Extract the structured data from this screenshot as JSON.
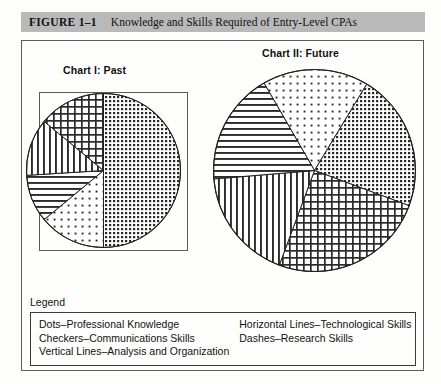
{
  "banner": {
    "figure_number": "FIGURE 1–1",
    "figure_title": "Knowledge and Skills Required of Entry-Level CPAs",
    "background_color": "#b9b9b9"
  },
  "charts": {
    "chart1_heading": "Chart I: Past",
    "chart2_heading": "Chart II: Future"
  },
  "legend": {
    "label": "Legend",
    "left_column": [
      "Dots–Professional Knowledge",
      "Checkers–Communications Skills",
      "Vertical Lines–Analysis and Organization"
    ],
    "right_column": [
      "Horizontal Lines–Technological Skills",
      "Dashes–Research Skills"
    ]
  },
  "chart_data": [
    {
      "type": "pie",
      "title": "Chart I: Past",
      "categories": [
        "Dots–Professional Knowledge",
        "Dashes–Research Skills",
        "Horizontal Lines–Technological Skills",
        "Vertical Lines–Analysis and Organization",
        "Checkers–Communications Skills"
      ],
      "values": [
        50,
        14,
        10,
        12,
        14
      ],
      "units": "percent",
      "patterns": [
        "dense-dots",
        "sparse-dots",
        "horizontal-lines",
        "vertical-lines",
        "checkers"
      ],
      "legend_position": "below",
      "grid": false
    },
    {
      "type": "pie",
      "title": "Chart II: Future",
      "categories": [
        "Dashes–Research Skills",
        "Dots–Professional Knowledge",
        "Checkers–Communications Skills",
        "Vertical Lines–Analysis and Organization",
        "Horizontal Lines–Technological Skills"
      ],
      "values": [
        17,
        22,
        25,
        18,
        18
      ],
      "units": "percent",
      "patterns": [
        "sparse-dots",
        "dense-dots",
        "checkers",
        "vertical-lines",
        "horizontal-lines"
      ],
      "legend_position": "below",
      "grid": false
    }
  ]
}
